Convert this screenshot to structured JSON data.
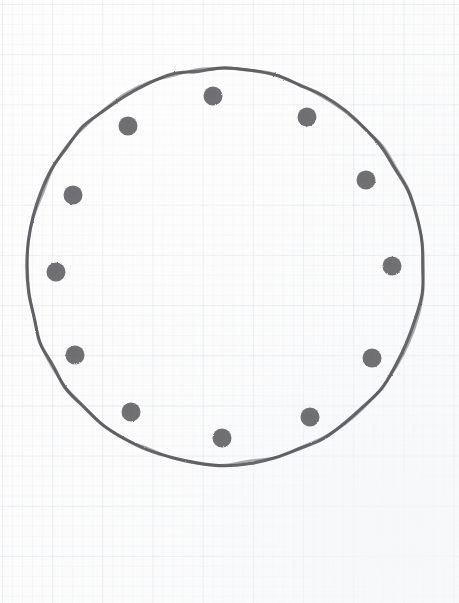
{
  "figure": {
    "medium": "pencil sketch on graph paper",
    "paper": {
      "background_color": "#fdfdfd",
      "minor_grid_color": "#7882960e",
      "major_grid_color": "#7882961a",
      "minor_grid_spacing_px": 10,
      "major_grid_spacing_px": 50
    }
  },
  "chart_data": {
    "type": "scatter",
    "xlabel": "",
    "ylabel": "",
    "xlim": [
      0,
      459
    ],
    "ylim": [
      0,
      603
    ],
    "grid": true,
    "legend": "none",
    "annotations": [],
    "shapes": [
      {
        "name": "outer-circle",
        "kind": "circle",
        "cx": 224,
        "cy": 267,
        "r": 198,
        "stroke_color": "#5a5a5e",
        "stroke_width": 3.1,
        "fill": "none",
        "style": "hand-drawn"
      }
    ],
    "series": [
      {
        "name": "perimeter-dots",
        "marker": "filled-circle",
        "marker_radius_px": 9.5,
        "color": "#5d5d60",
        "count": 12,
        "points": [
          {
            "label": "dot-12-oclock",
            "clock": 12,
            "angle_deg": 90,
            "x": 213,
            "y": 96
          },
          {
            "label": "dot-1-oclock",
            "clock": 1,
            "angle_deg": 60,
            "x": 307,
            "y": 117
          },
          {
            "label": "dot-2-oclock",
            "clock": 2,
            "angle_deg": 30,
            "x": 366,
            "y": 180
          },
          {
            "label": "dot-3-oclock",
            "clock": 3,
            "angle_deg": 0,
            "x": 392,
            "y": 266
          },
          {
            "label": "dot-4-oclock",
            "clock": 4,
            "angle_deg": -30,
            "x": 372,
            "y": 358
          },
          {
            "label": "dot-5-oclock",
            "clock": 5,
            "angle_deg": -60,
            "x": 310,
            "y": 417
          },
          {
            "label": "dot-6-oclock",
            "clock": 6,
            "angle_deg": -90,
            "x": 222,
            "y": 438
          },
          {
            "label": "dot-7-oclock",
            "clock": 7,
            "angle_deg": -120,
            "x": 131,
            "y": 412
          },
          {
            "label": "dot-8-oclock",
            "clock": 8,
            "angle_deg": -150,
            "x": 75,
            "y": 355
          },
          {
            "label": "dot-9-oclock",
            "clock": 9,
            "angle_deg": 180,
            "x": 56,
            "y": 272
          },
          {
            "label": "dot-10-oclock",
            "clock": 10,
            "angle_deg": 150,
            "x": 73,
            "y": 195
          },
          {
            "label": "dot-11-oclock",
            "clock": 11,
            "angle_deg": 120,
            "x": 128,
            "y": 126
          }
        ]
      }
    ],
    "colors": {
      "ink": "#5a5a5e",
      "dot": "#5d5d60",
      "paper": "#fdfdfd"
    }
  }
}
